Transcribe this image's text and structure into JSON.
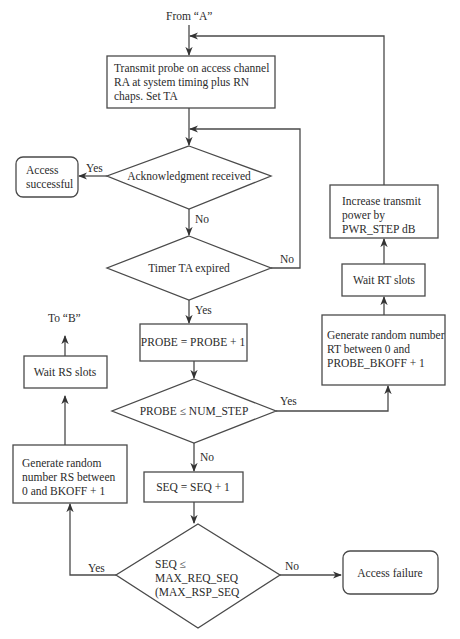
{
  "diagram": {
    "start_label": "From “A”",
    "exit_label": "To “B”",
    "nodes": {
      "transmit_probe": [
        "Transmit probe on access channel",
        "RA at system timing plus RN",
        "chaps.  Set TA"
      ],
      "ack_received": [
        "Acknowledgment received"
      ],
      "access_successful": [
        "Access",
        "successful"
      ],
      "timer_expired": [
        "Timer TA expired"
      ],
      "probe_increment": [
        "PROBE = PROBE + 1"
      ],
      "probe_check": [
        "PROBE ≤ NUM_STEP"
      ],
      "generate_rt": [
        "Generate random number",
        "RT between 0 and",
        "PROBE_BKOFF + 1"
      ],
      "wait_rt": [
        "Wait RT slots"
      ],
      "increase_power": [
        "Increase transmit",
        "power by",
        "PWR_STEP dB"
      ],
      "seq_increment": [
        "SEQ = SEQ  + 1"
      ],
      "seq_check": [
        "SEQ ≤",
        "MAX_REQ_SEQ",
        "(MAX_RSP_SEQ"
      ],
      "generate_rs": [
        "Generate random",
        "number RS between",
        "0 and BKOFF +  1"
      ],
      "wait_rs": [
        "Wait RS slots"
      ],
      "access_failure": [
        "Access failure"
      ]
    },
    "edge_labels": {
      "ack_yes": "Yes",
      "ack_no": "No",
      "timer_no": "No",
      "timer_yes": "Yes",
      "probe_yes": "Yes",
      "probe_no": "No",
      "seq_yes": "Yes",
      "seq_no": "No"
    }
  }
}
